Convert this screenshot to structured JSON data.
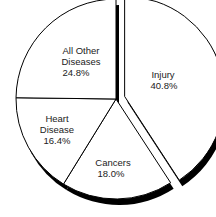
{
  "chart_data": {
    "type": "pie",
    "title": "",
    "slices": [
      {
        "label": "Injury",
        "value": 40.8,
        "display": "40.8%",
        "exploded": true
      },
      {
        "label": "Cancers",
        "value": 18.0,
        "display": "18.0%",
        "exploded": false
      },
      {
        "label": "Heart Disease",
        "value": 16.4,
        "display": "16.4%",
        "exploded": false
      },
      {
        "label": "All Other Diseases",
        "value": 24.8,
        "display": "24.8%",
        "exploded": false
      }
    ],
    "style": {
      "fill": "#ffffff",
      "stroke": "#000000",
      "shadow": "#000000",
      "three_d_edge": true
    },
    "legend": "none"
  },
  "labels": {
    "injury": {
      "line1": "Injury",
      "line2": "40.8%"
    },
    "cancers": {
      "line1": "Cancers",
      "line2": "18.0%"
    },
    "heart": {
      "line1": "Heart",
      "line2": "Disease",
      "line3": "16.4%"
    },
    "other": {
      "line1": "All Other",
      "line2": "Diseases",
      "line3": "24.8%"
    }
  }
}
